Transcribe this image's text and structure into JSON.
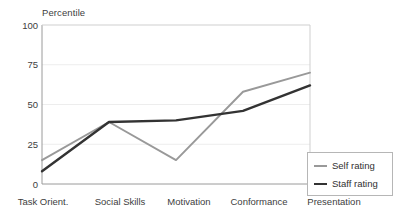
{
  "chart_data": {
    "type": "line",
    "title": "Percentile",
    "xlabel": "",
    "ylabel": "Percentile",
    "ylim": [
      0,
      100
    ],
    "yticks": [
      0,
      25,
      50,
      75,
      100
    ],
    "grid": true,
    "legend_position": "bottom-right",
    "categories": [
      "Task Orient.",
      "Social Skills",
      "Motivation",
      "Conformance",
      "Presentation"
    ],
    "series": [
      {
        "name": "Self rating",
        "values": [
          15,
          39,
          15,
          58,
          70
        ],
        "color": "#999999"
      },
      {
        "name": "Staff rating",
        "values": [
          8,
          39,
          40,
          46,
          62
        ],
        "color": "#333333"
      }
    ]
  },
  "axis": {
    "y_tick_labels": [
      "100",
      "75",
      "50",
      "25",
      "0"
    ],
    "x_tick_labels": [
      "Task Orient.",
      "Social Skills",
      "Motivation",
      "Conformance",
      "Presentation"
    ],
    "title_label": "Percentile"
  },
  "legend": {
    "entries": [
      {
        "label": "Self rating"
      },
      {
        "label": "Staff rating"
      }
    ]
  },
  "colors": {
    "self_rating": "#999999",
    "staff_rating": "#333333",
    "axis": "#9a9a9a",
    "grid": "#ededed",
    "text": "#404040"
  }
}
